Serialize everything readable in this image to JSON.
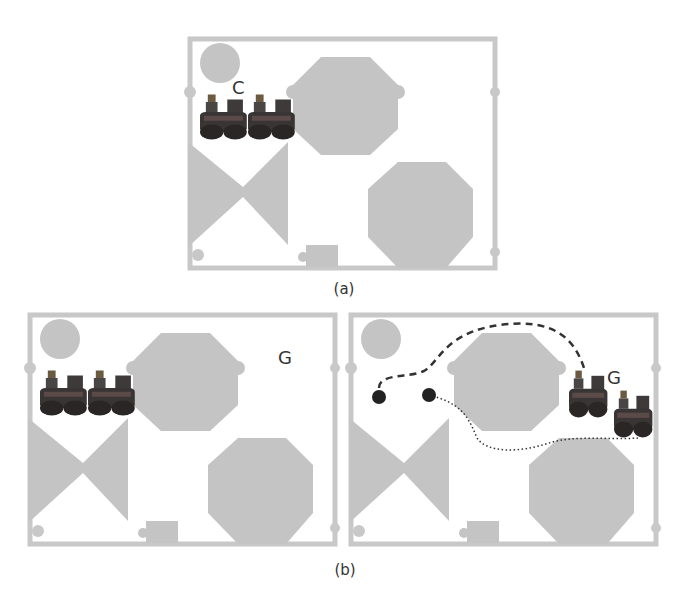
{
  "figure": {
    "panels": [
      {
        "id": "a",
        "caption": "(a)",
        "label": "C",
        "label_meaning": "configuration"
      },
      {
        "id": "b",
        "caption": "(b)",
        "subpanels": [
          {
            "label": "G",
            "note": "start: two robots at left, goal G at right"
          },
          {
            "label": "G",
            "note": "paths: dashed and dotted routes from start dots to goal robots"
          }
        ]
      }
    ]
  },
  "colors": {
    "obstacle": "#c4c4c4",
    "wall": "#c8c8c8",
    "background": "#ffffff",
    "robot": "#3a3535",
    "path": "#333333",
    "start_dot": "#222222",
    "text": "#333333"
  }
}
